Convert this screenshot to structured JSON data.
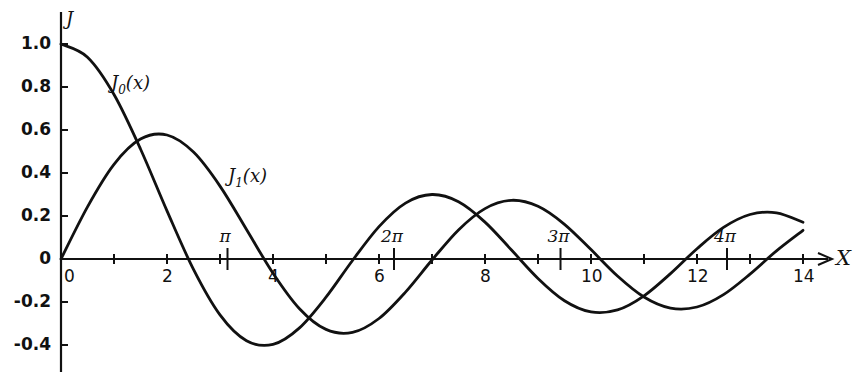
{
  "chart_data": {
    "type": "line",
    "title": "",
    "xlabel": "X",
    "ylabel": "J",
    "xlim": [
      0,
      14.5
    ],
    "ylim": [
      -0.5,
      1.1
    ],
    "grid": false,
    "x_ticks": [
      {
        "value": 0,
        "label": "0"
      },
      {
        "value": 1,
        "label": ""
      },
      {
        "value": 2,
        "label": "2"
      },
      {
        "value": 3,
        "label": ""
      },
      {
        "value": 4,
        "label": "4"
      },
      {
        "value": 5,
        "label": ""
      },
      {
        "value": 6,
        "label": "6"
      },
      {
        "value": 7,
        "label": ""
      },
      {
        "value": 8,
        "label": "8"
      },
      {
        "value": 9,
        "label": ""
      },
      {
        "value": 10,
        "label": "10"
      },
      {
        "value": 11,
        "label": ""
      },
      {
        "value": 12,
        "label": "12"
      },
      {
        "value": 13,
        "label": ""
      },
      {
        "value": 14,
        "label": "14"
      }
    ],
    "pi_ticks": [
      {
        "value": 3.1416,
        "label": "π"
      },
      {
        "value": 6.2832,
        "label": "2π"
      },
      {
        "value": 9.4248,
        "label": "3π"
      },
      {
        "value": 12.5664,
        "label": "4π"
      }
    ],
    "y_ticks": [
      {
        "value": 1.0,
        "label": "1.0"
      },
      {
        "value": 0.8,
        "label": "0.8"
      },
      {
        "value": 0.6,
        "label": "0.6"
      },
      {
        "value": 0.4,
        "label": "0.4"
      },
      {
        "value": 0.2,
        "label": "0.2"
      },
      {
        "value": 0,
        "label": "0"
      },
      {
        "value": -0.2,
        "label": "-0.2"
      },
      {
        "value": -0.4,
        "label": "-0.4"
      }
    ],
    "x": [
      0,
      0.5,
      1,
      1.5,
      2,
      2.5,
      3,
      3.5,
      4,
      4.5,
      5,
      5.5,
      6,
      6.5,
      7,
      7.5,
      8,
      8.5,
      9,
      9.5,
      10,
      10.5,
      11,
      11.5,
      12,
      12.5,
      13,
      13.5,
      14
    ],
    "series": [
      {
        "name": "J0(x)",
        "label_main": "J",
        "label_sub": "0",
        "label_arg": "(x)",
        "values": [
          1.0,
          0.9385,
          0.7652,
          0.5118,
          0.2239,
          -0.0484,
          -0.2601,
          -0.3801,
          -0.3971,
          -0.3205,
          -0.1776,
          -0.0068,
          0.1506,
          0.2601,
          0.3001,
          0.2663,
          0.1717,
          0.0419,
          -0.0903,
          -0.1939,
          -0.2459,
          -0.2366,
          -0.1712,
          -0.0677,
          0.0477,
          0.1469,
          0.2069,
          0.215,
          0.1711
        ]
      },
      {
        "name": "J1(x)",
        "label_main": "J",
        "label_sub": "1",
        "label_arg": "(x)",
        "values": [
          0,
          0.2423,
          0.4401,
          0.5579,
          0.5767,
          0.4971,
          0.3391,
          0.1374,
          -0.066,
          -0.2311,
          -0.3276,
          -0.3414,
          -0.2767,
          -0.1538,
          -0.0047,
          0.1352,
          0.2346,
          0.2731,
          0.2453,
          0.1613,
          0.0435,
          -0.0789,
          -0.1768,
          -0.2284,
          -0.2234,
          -0.1655,
          -0.0703,
          0.038,
          0.1334
        ]
      }
    ]
  }
}
